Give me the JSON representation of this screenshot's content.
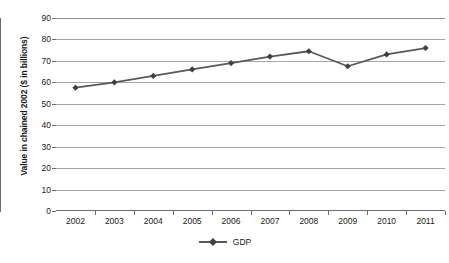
{
  "chart_data": {
    "type": "line",
    "title": "",
    "xlabel": "",
    "ylabel": "Value in chained 2002 ($ in billions)",
    "categories": [
      "2002",
      "2003",
      "2004",
      "2005",
      "2006",
      "2007",
      "2008",
      "2009",
      "2010",
      "2011"
    ],
    "series": [
      {
        "name": "GDP",
        "values": [
          57.5,
          60.0,
          63.0,
          66.0,
          69.0,
          72.0,
          74.5,
          67.5,
          73.0,
          76.0
        ]
      }
    ],
    "ylim": [
      0,
      90
    ],
    "y_ticks": [
      "0",
      "10",
      "20",
      "30",
      "40",
      "50",
      "60",
      "70",
      "80",
      "90"
    ],
    "y_tick_step": 10,
    "grid": true,
    "legend_position": "bottom",
    "colors": {
      "line": "#595959",
      "marker": "#404040",
      "gridline": "#a6a6a6",
      "axis": "#6e6e6e",
      "text": "#1a1a1a",
      "background": "#ffffff"
    }
  },
  "legend": {
    "entries": [
      {
        "label": "GDP"
      }
    ]
  }
}
